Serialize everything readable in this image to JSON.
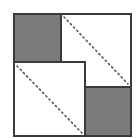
{
  "diagram": {
    "type": "square-dissection",
    "colors": {
      "background": "#ffffff",
      "stroke": "#3a3a3a",
      "shaded": "#7b7b7b",
      "dots": "#555555"
    },
    "outer_square": {
      "x": 14,
      "y": 14,
      "w": 117,
      "h": 122
    },
    "shaded_squares": [
      {
        "id": "top-left",
        "x": 14,
        "y": 14,
        "w": 47,
        "h": 48
      },
      {
        "id": "bottom-right",
        "x": 85,
        "y": 87,
        "w": 46,
        "h": 49
      }
    ],
    "white_squares": [
      {
        "id": "top-right",
        "x": 61,
        "y": 14,
        "w": 70,
        "h": 73
      },
      {
        "id": "bottom-left",
        "x": 14,
        "y": 62,
        "w": 71,
        "h": 74
      }
    ],
    "dotted_diagonals": [
      {
        "id": "top-right-diagonal",
        "x1": 64,
        "y1": 17,
        "x2": 128,
        "y2": 84
      },
      {
        "id": "bottom-left-diagonal",
        "x1": 17,
        "y1": 66,
        "x2": 82,
        "y2": 133
      }
    ]
  }
}
